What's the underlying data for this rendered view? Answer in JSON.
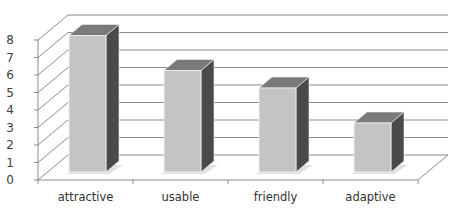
{
  "chart_data": {
    "type": "bar",
    "style": "3d-column",
    "title": "",
    "xlabel": "",
    "ylabel": "",
    "categories": [
      "attractive",
      "usable",
      "friendly",
      "adaptive"
    ],
    "values": [
      7.8,
      5.8,
      4.8,
      2.8
    ],
    "ylim": [
      0,
      8
    ],
    "yticks": [
      "0",
      "1",
      "2",
      "3",
      "4",
      "5",
      "6",
      "7",
      "8"
    ],
    "grid": true,
    "legend": null,
    "colors": {
      "bar_front": "#c4c4c4",
      "bar_top": "#7a7a7a",
      "bar_side": "#4a4a4a",
      "gridline": "#8c8c8c",
      "axis": "#8c8c8c",
      "shadow": "#d9d9d9"
    }
  }
}
